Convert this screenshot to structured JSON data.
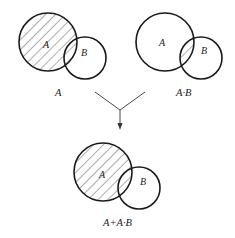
{
  "diagram": {
    "type": "venn-absorption-law",
    "colors": {
      "stroke": "#1a1a1a",
      "hatch": "#333333",
      "background": "#ffffff"
    },
    "panels": [
      {
        "id": "top-left",
        "caption": "A",
        "circle_a_label": "A",
        "circle_b_label": "B",
        "shaded_region": "A"
      },
      {
        "id": "top-right",
        "caption": "A·B",
        "circle_a_label": "A",
        "circle_b_label": "B",
        "shaded_region": "A∩B"
      },
      {
        "id": "bottom",
        "caption": "A+A·B",
        "circle_a_label": "A",
        "circle_b_label": "B",
        "shaded_region": "A"
      }
    ],
    "connector": {
      "kind": "merge-arrow",
      "from": [
        "top-left",
        "top-right"
      ],
      "to": "bottom"
    }
  }
}
